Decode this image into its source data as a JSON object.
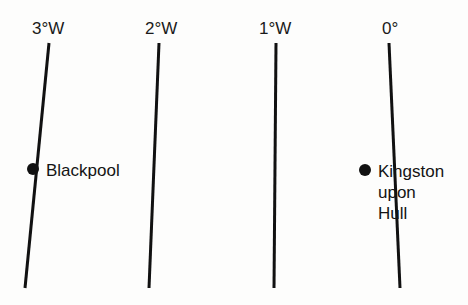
{
  "figure": {
    "background_color": "#fdfdfc",
    "line_color": "#111111",
    "text_color": "#1a1a1a"
  },
  "meridians": [
    {
      "label": "3°W",
      "label_x": 32,
      "label_y": 20,
      "x_top": 49,
      "x_bottom": 25,
      "y_top": 43,
      "y_bottom": 288
    },
    {
      "label": "2°W",
      "label_x": 145,
      "label_y": 20,
      "x_top": 159,
      "x_bottom": 149,
      "y_top": 43,
      "y_bottom": 288
    },
    {
      "label": "1°W",
      "label_x": 259,
      "label_y": 20,
      "x_top": 276,
      "x_bottom": 274,
      "y_top": 43,
      "y_bottom": 288
    },
    {
      "label": "0°",
      "label_x": 382,
      "label_y": 20,
      "x_top": 389,
      "x_bottom": 400,
      "y_top": 43,
      "y_bottom": 288
    }
  ],
  "cities": [
    {
      "name": "Blackpool",
      "dot_x": 27,
      "dot_y": 163,
      "label_x": 46,
      "label_y": 160,
      "lines": [
        "Blackpool"
      ]
    },
    {
      "name": "Kingston upon Hull",
      "dot_x": 359,
      "dot_y": 164,
      "label_x": 378,
      "label_y": 161,
      "lines": [
        "Kingston",
        "upon",
        "Hull"
      ]
    }
  ]
}
